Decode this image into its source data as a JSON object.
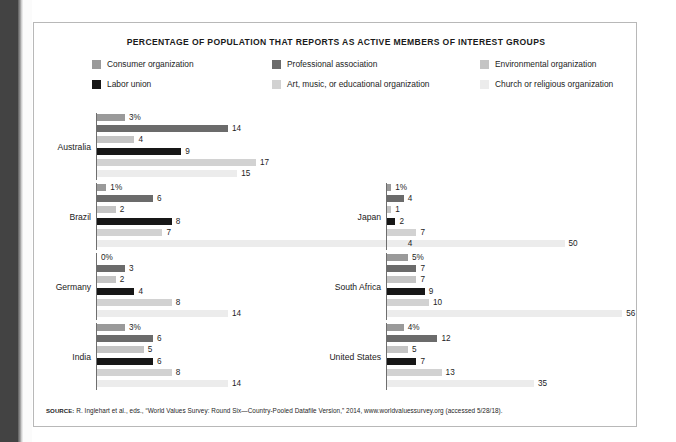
{
  "figure": {
    "title": "PERCENTAGE OF POPULATION THAT REPORTS AS  ACTIVE MEMBERS OF INTEREST GROUPS",
    "source_kicker": "SOURCE:",
    "source_text": " R. Inglehart et al., eds., “World Values Survey: Round Six—Country-Pooled Datafile Version,” 2014, www.worldvaluessurvey.org (accessed 5/28/18)."
  },
  "legend": {
    "items": [
      {
        "label": "Consumer organization",
        "color": "#9a9a9a"
      },
      {
        "label": "Professional association",
        "color": "#6b6b6b"
      },
      {
        "label": "Environmental organization",
        "color": "#c4c4c4"
      },
      {
        "label": "Labor union",
        "color": "#171717"
      },
      {
        "label": "Art, music, or educational organization",
        "color": "#d2d2d2"
      },
      {
        "label": "Church or religious organization",
        "color": "#ececec"
      }
    ]
  },
  "chart_data": {
    "type": "bar",
    "title": "PERCENTAGE OF POPULATION THAT REPORTS AS  ACTIVE MEMBERS OF INTEREST GROUPS",
    "orientation": "horizontal",
    "xlabel": "",
    "ylabel": "",
    "xlim": [
      0,
      56
    ],
    "grid": false,
    "legend_position": "top",
    "categories": [
      "Australia",
      "Brazil",
      "Germany",
      "India",
      "Japan",
      "South Africa",
      "United States"
    ],
    "series": [
      {
        "name": "Consumer organization",
        "color": "#9a9a9a",
        "values": [
          3,
          1,
          0,
          3,
          1,
          5,
          4
        ]
      },
      {
        "name": "Professional association",
        "color": "#6b6b6b",
        "values": [
          14,
          6,
          3,
          6,
          4,
          7,
          12
        ]
      },
      {
        "name": "Environmental organization",
        "color": "#c4c4c4",
        "values": [
          4,
          2,
          2,
          5,
          1,
          7,
          5
        ]
      },
      {
        "name": "Labor union",
        "color": "#171717",
        "values": [
          9,
          8,
          4,
          6,
          2,
          9,
          7
        ]
      },
      {
        "name": "Art, music, or educational organization",
        "color": "#d2d2d2",
        "values": [
          17,
          7,
          8,
          8,
          7,
          10,
          13
        ]
      },
      {
        "name": "Church or religious organization",
        "color": "#ececec",
        "values": [
          15,
          50,
          14,
          14,
          4,
          56,
          35
        ]
      }
    ]
  },
  "panels": [
    {
      "country": "Australia",
      "bars": [
        {
          "series": "Consumer organization",
          "value": 3,
          "label": "3%",
          "color": "#9a9a9a"
        },
        {
          "series": "Professional association",
          "value": 14,
          "label": "14",
          "color": "#6b6b6b"
        },
        {
          "series": "Environmental organization",
          "value": 4,
          "label": "4",
          "color": "#c4c4c4"
        },
        {
          "series": "Labor union",
          "value": 9,
          "label": "9",
          "color": "#171717"
        },
        {
          "series": "Art, music, or educational organization",
          "value": 17,
          "label": "17",
          "color": "#d2d2d2"
        },
        {
          "series": "Church or religious organization",
          "value": 15,
          "label": "15",
          "color": "#ececec"
        }
      ]
    },
    {
      "country": "Brazil",
      "bars": [
        {
          "series": "Consumer organization",
          "value": 1,
          "label": "1%",
          "color": "#9a9a9a"
        },
        {
          "series": "Professional association",
          "value": 6,
          "label": "6",
          "color": "#6b6b6b"
        },
        {
          "series": "Environmental organization",
          "value": 2,
          "label": "2",
          "color": "#c4c4c4"
        },
        {
          "series": "Labor union",
          "value": 8,
          "label": "8",
          "color": "#171717"
        },
        {
          "series": "Art, music, or educational organization",
          "value": 7,
          "label": "7",
          "color": "#d2d2d2"
        },
        {
          "series": "Church or religious organization",
          "value": 50,
          "label": "50",
          "color": "#ececec"
        }
      ]
    },
    {
      "country": "Germany",
      "bars": [
        {
          "series": "Consumer organization",
          "value": 0,
          "label": "0%",
          "color": "#9a9a9a"
        },
        {
          "series": "Professional association",
          "value": 3,
          "label": "3",
          "color": "#6b6b6b"
        },
        {
          "series": "Environmental organization",
          "value": 2,
          "label": "2",
          "color": "#c4c4c4"
        },
        {
          "series": "Labor union",
          "value": 4,
          "label": "4",
          "color": "#171717"
        },
        {
          "series": "Art, music, or educational organization",
          "value": 8,
          "label": "8",
          "color": "#d2d2d2"
        },
        {
          "series": "Church or religious organization",
          "value": 14,
          "label": "14",
          "color": "#ececec"
        }
      ]
    },
    {
      "country": "India",
      "bars": [
        {
          "series": "Consumer organization",
          "value": 3,
          "label": "3%",
          "color": "#9a9a9a"
        },
        {
          "series": "Professional association",
          "value": 6,
          "label": "6",
          "color": "#6b6b6b"
        },
        {
          "series": "Environmental organization",
          "value": 5,
          "label": "5",
          "color": "#c4c4c4"
        },
        {
          "series": "Labor union",
          "value": 6,
          "label": "6",
          "color": "#171717"
        },
        {
          "series": "Art, music, or educational organization",
          "value": 8,
          "label": "8",
          "color": "#d2d2d2"
        },
        {
          "series": "Church or religious organization",
          "value": 14,
          "label": "14",
          "color": "#ececec"
        }
      ]
    },
    {
      "country": "Japan",
      "bars": [
        {
          "series": "Consumer organization",
          "value": 1,
          "label": "1%",
          "color": "#9a9a9a"
        },
        {
          "series": "Professional association",
          "value": 4,
          "label": "4",
          "color": "#6b6b6b"
        },
        {
          "series": "Environmental organization",
          "value": 1,
          "label": "1",
          "color": "#c4c4c4"
        },
        {
          "series": "Labor union",
          "value": 2,
          "label": "2",
          "color": "#171717"
        },
        {
          "series": "Art, music, or educational organization",
          "value": 7,
          "label": "7",
          "color": "#d2d2d2"
        },
        {
          "series": "Church or religious organization",
          "value": 4,
          "label": "4",
          "color": "#ececec"
        }
      ]
    },
    {
      "country": "South Africa",
      "bars": [
        {
          "series": "Consumer organization",
          "value": 5,
          "label": "5%",
          "color": "#9a9a9a"
        },
        {
          "series": "Professional association",
          "value": 7,
          "label": "7",
          "color": "#6b6b6b"
        },
        {
          "series": "Environmental organization",
          "value": 7,
          "label": "7",
          "color": "#c4c4c4"
        },
        {
          "series": "Labor union",
          "value": 9,
          "label": "9",
          "color": "#171717"
        },
        {
          "series": "Art, music, or educational organization",
          "value": 10,
          "label": "10",
          "color": "#d2d2d2"
        },
        {
          "series": "Church or religious organization",
          "value": 56,
          "label": "56",
          "color": "#ececec"
        }
      ]
    },
    {
      "country": "United States",
      "bars": [
        {
          "series": "Consumer organization",
          "value": 4,
          "label": "4%",
          "color": "#9a9a9a"
        },
        {
          "series": "Professional association",
          "value": 12,
          "label": "12",
          "color": "#6b6b6b"
        },
        {
          "series": "Environmental organization",
          "value": 5,
          "label": "5",
          "color": "#c4c4c4"
        },
        {
          "series": "Labor union",
          "value": 7,
          "label": "7",
          "color": "#171717"
        },
        {
          "series": "Art, music, or educational organization",
          "value": 13,
          "label": "13",
          "color": "#d2d2d2"
        },
        {
          "series": "Church or religious organization",
          "value": 35,
          "label": "35",
          "color": "#ececec"
        }
      ]
    }
  ]
}
